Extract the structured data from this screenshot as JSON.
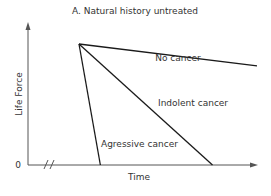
{
  "chart_data": {
    "type": "line",
    "title": "A.  Natural history untreated",
    "xlabel": "Time",
    "ylabel": "Life Force",
    "y_origin_label": "0",
    "x_axis_break": true,
    "xlim": [
      0,
      1
    ],
    "ylim": [
      0,
      1
    ],
    "grid": false,
    "legend": "none (inline labels)",
    "series": [
      {
        "name": "No cancer",
        "label": "No cancer",
        "points": [
          [
            0,
            1
          ],
          [
            1,
            0.82
          ]
        ]
      },
      {
        "name": "Indolent cancer",
        "label": "Indolent cancer",
        "points": [
          [
            0,
            1
          ],
          [
            0.75,
            0
          ]
        ]
      },
      {
        "name": "Aggressive cancer",
        "label": "Agressive cancer",
        "points": [
          [
            0,
            1
          ],
          [
            0.12,
            0
          ]
        ]
      }
    ]
  }
}
